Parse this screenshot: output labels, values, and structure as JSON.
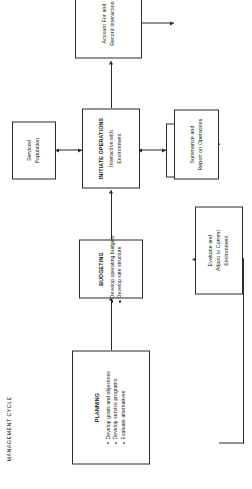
{
  "figure": {
    "title": "MANAGEMENT CYCLE",
    "line_color": "#2b2b2b",
    "text_color": "#111111",
    "background": "#ffffff"
  },
  "nodes": {
    "planning": {
      "title": "PLANNING",
      "bullets": [
        "Develop goals and objectives",
        "Develop service programs",
        "Evaluate alternatives"
      ]
    },
    "budgeting": {
      "title": "BUDGETING",
      "bullets": [
        "Develop operating budgets",
        "Develop rate structure"
      ]
    },
    "initiate_operations": {
      "title": "INITIATE OPERATIONS",
      "sub_line_1": "Interaction with",
      "sub_line_2": "Environment"
    },
    "serviced_population": {
      "line_1": "Serviced",
      "line_2": "Population"
    },
    "participating_providers": {
      "line_1": "Participating",
      "line_2": "Providers"
    },
    "account_record": {
      "line_1": "Account For and",
      "line_2": "Record Interaction"
    },
    "summarize_report": {
      "line_1": "Summarize and",
      "line_2": "Report on Operations"
    },
    "evaluate_adjust": {
      "line_1": "Evaluate and",
      "line_2": "Adjust to Current",
      "line_3": "Environment"
    }
  },
  "connectors": [
    {
      "name": "planning-to-budgeting",
      "kind": "single-arrow"
    },
    {
      "name": "budgeting-to-initiate-operations",
      "kind": "single-arrow"
    },
    {
      "name": "serviced-population-to-initiate-operations",
      "kind": "double-arrow"
    },
    {
      "name": "participating-providers-to-initiate-operations",
      "kind": "double-arrow"
    },
    {
      "name": "initiate-operations-to-account-record",
      "kind": "single-arrow"
    },
    {
      "name": "account-record-to-summarize-report",
      "kind": "single-arrow"
    },
    {
      "name": "summarize-report-to-evaluate-adjust",
      "kind": "single-arrow"
    },
    {
      "name": "evaluate-adjust-to-planning-feedback",
      "kind": "single-arrow"
    }
  ]
}
